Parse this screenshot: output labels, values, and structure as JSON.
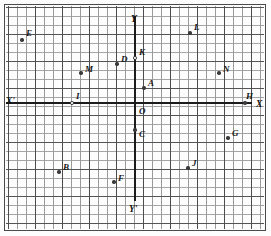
{
  "figure": {
    "type": "coordinate-plane",
    "grid": {
      "minor_cell_px": 9,
      "major_every_cells": 3,
      "minor_color": "#9a9a9a",
      "major_color": "#4d4d4d",
      "background": "#fdfdfd"
    },
    "axes": {
      "origin_label": "O",
      "x_positive_label": "X",
      "x_negative_label": "X'",
      "y_positive_label": "Y",
      "y_negative_label": "Y'",
      "axis_color": "#1c1c1c"
    }
  },
  "chart_data": {
    "type": "scatter",
    "xlabel": "X",
    "ylabel": "Y",
    "grid": true,
    "legend": "none",
    "origin_px": {
      "x": 135,
      "y": 103
    },
    "cell_px": 9,
    "xlim": [
      -14.3,
      13.6
    ],
    "ylim": [
      -14.3,
      10.7
    ],
    "points": [
      {
        "label": "E",
        "x": -12.5,
        "y": 7.0,
        "marker": "filled",
        "px": 22,
        "py": 40,
        "lx": 26,
        "ly": 29
      },
      {
        "label": "L",
        "x": 6.1,
        "y": 7.8,
        "marker": "filled",
        "px": 190,
        "py": 33,
        "lx": 194,
        "ly": 23
      },
      {
        "label": "K",
        "x": 0.0,
        "y": 5.0,
        "marker": "hollow",
        "px": 135,
        "py": 58,
        "lx": 139,
        "ly": 48
      },
      {
        "label": "D",
        "x": -2.0,
        "y": 4.3,
        "marker": "filled",
        "px": 117,
        "py": 64,
        "lx": 121,
        "ly": 55
      },
      {
        "label": "M",
        "x": -6.0,
        "y": 3.3,
        "marker": "filled",
        "px": 81,
        "py": 73,
        "lx": 85,
        "ly": 65
      },
      {
        "label": "N",
        "x": 9.3,
        "y": 3.3,
        "marker": "filled",
        "px": 219,
        "py": 73,
        "lx": 223,
        "ly": 65
      },
      {
        "label": "A",
        "x": 1.0,
        "y": 1.7,
        "marker": "filled",
        "px": 144,
        "py": 88,
        "lx": 148,
        "ly": 79
      },
      {
        "label": "I",
        "x": -7.0,
        "y": 0.0,
        "marker": "hollow",
        "px": 72,
        "py": 103,
        "lx": 76,
        "ly": 92
      },
      {
        "label": "H",
        "x": 12.2,
        "y": 0.0,
        "marker": "filled",
        "px": 245,
        "py": 103,
        "lx": 246,
        "ly": 92
      },
      {
        "label": "O",
        "x": 0.0,
        "y": 0.0,
        "marker": "none",
        "px": 135,
        "py": 103,
        "lx": 139,
        "ly": 107
      },
      {
        "label": "C",
        "x": 0.0,
        "y": -3.0,
        "marker": "filled",
        "px": 135,
        "py": 130,
        "lx": 139,
        "ly": 130
      },
      {
        "label": "G",
        "x": 10.3,
        "y": -3.9,
        "marker": "filled",
        "px": 228,
        "py": 138,
        "lx": 232,
        "ly": 129
      },
      {
        "label": "J",
        "x": 5.9,
        "y": -7.2,
        "marker": "filled",
        "px": 188,
        "py": 168,
        "lx": 192,
        "ly": 159
      },
      {
        "label": "B",
        "x": -8.4,
        "y": -7.7,
        "marker": "filled",
        "px": 59,
        "py": 172,
        "lx": 63,
        "ly": 163
      },
      {
        "label": "F",
        "x": -2.3,
        "y": -8.8,
        "marker": "filled",
        "px": 114,
        "py": 182,
        "lx": 118,
        "ly": 174
      }
    ],
    "axis_end_labels": [
      {
        "label": "Y",
        "px": 136,
        "py": 16,
        "lx": 131,
        "ly": 15,
        "anchor": "top"
      },
      {
        "label": "Y'",
        "px": 136,
        "py": 201,
        "lx": 129,
        "ly": 205,
        "anchor": "bottom"
      },
      {
        "label": "X'",
        "px": 6,
        "py": 103,
        "lx": 6,
        "ly": 97,
        "anchor": "left"
      },
      {
        "label": "X",
        "px": 253,
        "py": 103,
        "lx": 256,
        "ly": 100,
        "anchor": "right"
      }
    ]
  }
}
